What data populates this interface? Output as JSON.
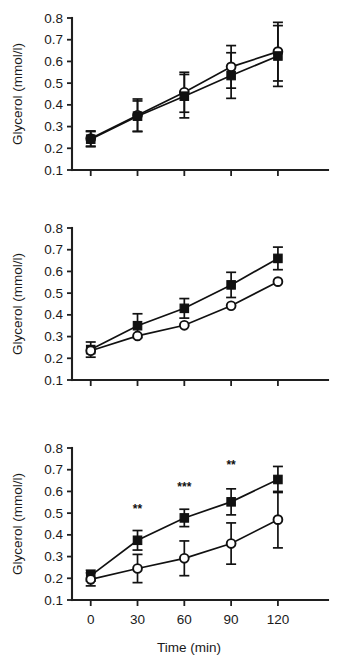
{
  "figure": {
    "background": "#ffffff",
    "ink_color": "#111111",
    "panel_count": 3
  },
  "chart_data": [
    {
      "id": "panel-a",
      "type": "line",
      "title": "",
      "xlabel": "",
      "ylabel": "Glycerol (mmol/l)",
      "x": [
        0,
        30,
        60,
        90,
        120
      ],
      "xticklabels": [
        "0",
        "30",
        "60",
        "90",
        "120"
      ],
      "xlim": [
        -12,
        138
      ],
      "ylim": [
        0.1,
        0.8
      ],
      "yticks": [
        0.1,
        0.2,
        0.3,
        0.4,
        0.5,
        0.6,
        0.7,
        0.8
      ],
      "yticklabels": [
        "0.1",
        "0.2",
        "0.3",
        "0.4",
        "0.5",
        "0.6",
        "0.7",
        "0.8"
      ],
      "grid": false,
      "legend": "none",
      "show_xticklabels": false,
      "series": [
        {
          "name": "open-circle-series",
          "marker": "open-circle",
          "values": [
            0.245,
            0.352,
            0.458,
            0.575,
            0.645
          ],
          "errors": [
            0.035,
            0.075,
            0.092,
            0.098,
            0.135
          ]
        },
        {
          "name": "filled-square-series",
          "marker": "filled-square",
          "values": [
            0.242,
            0.348,
            0.44,
            0.535,
            0.625
          ],
          "errors": [
            0.035,
            0.07,
            0.1,
            0.105,
            0.14
          ]
        }
      ],
      "annotations": []
    },
    {
      "id": "panel-b",
      "type": "line",
      "title": "",
      "xlabel": "",
      "ylabel": "Glycerol (mmol/l)",
      "x": [
        0,
        30,
        60,
        90,
        120
      ],
      "xticklabels": [
        "0",
        "30",
        "60",
        "90",
        "120"
      ],
      "xlim": [
        -12,
        138
      ],
      "ylim": [
        0.1,
        0.8
      ],
      "yticks": [
        0.1,
        0.2,
        0.3,
        0.4,
        0.5,
        0.6,
        0.7,
        0.8
      ],
      "yticklabels": [
        "0.1",
        "0.2",
        "0.3",
        "0.4",
        "0.5",
        "0.6",
        "0.7",
        "0.8"
      ],
      "grid": false,
      "legend": "none",
      "show_xticklabels": false,
      "series": [
        {
          "name": "filled-square-series",
          "marker": "filled-square",
          "values": [
            0.24,
            0.35,
            0.43,
            0.538,
            0.66
          ],
          "errors": [
            0.035,
            0.055,
            0.045,
            0.058,
            0.052
          ]
        },
        {
          "name": "open-circle-series",
          "marker": "open-circle",
          "values": [
            0.235,
            0.303,
            0.352,
            0.442,
            0.553
          ]
        }
      ],
      "annotations": []
    },
    {
      "id": "panel-c",
      "type": "line",
      "title": "",
      "xlabel": "Time (min)",
      "ylabel": "Glycerol (mmol/l)",
      "x": [
        0,
        30,
        60,
        90,
        120
      ],
      "xticklabels": [
        "0",
        "30",
        "60",
        "90",
        "120"
      ],
      "xlim": [
        -12,
        138
      ],
      "ylim": [
        0.1,
        0.8
      ],
      "yticks": [
        0.1,
        0.2,
        0.3,
        0.4,
        0.5,
        0.6,
        0.7,
        0.8
      ],
      "yticklabels": [
        "0.1",
        "0.2",
        "0.3",
        "0.4",
        "0.5",
        "0.6",
        "0.7",
        "0.8"
      ],
      "grid": false,
      "legend": "none",
      "show_xticklabels": true,
      "series": [
        {
          "name": "filled-square-series",
          "marker": "filled-square",
          "values": [
            0.212,
            0.375,
            0.478,
            0.552,
            0.655
          ],
          "errors": [
            0.025,
            0.045,
            0.04,
            0.06,
            0.06
          ]
        },
        {
          "name": "open-circle-series",
          "marker": "open-circle",
          "values": [
            0.195,
            0.245,
            0.292,
            0.36,
            0.47
          ],
          "errors": [
            0.03,
            0.065,
            0.08,
            0.095,
            0.13
          ]
        }
      ],
      "annotations": [
        {
          "x": 30,
          "y": 0.5,
          "text": "**"
        },
        {
          "x": 60,
          "y": 0.6,
          "text": "***"
        },
        {
          "x": 90,
          "y": 0.705,
          "text": "**"
        }
      ]
    }
  ]
}
